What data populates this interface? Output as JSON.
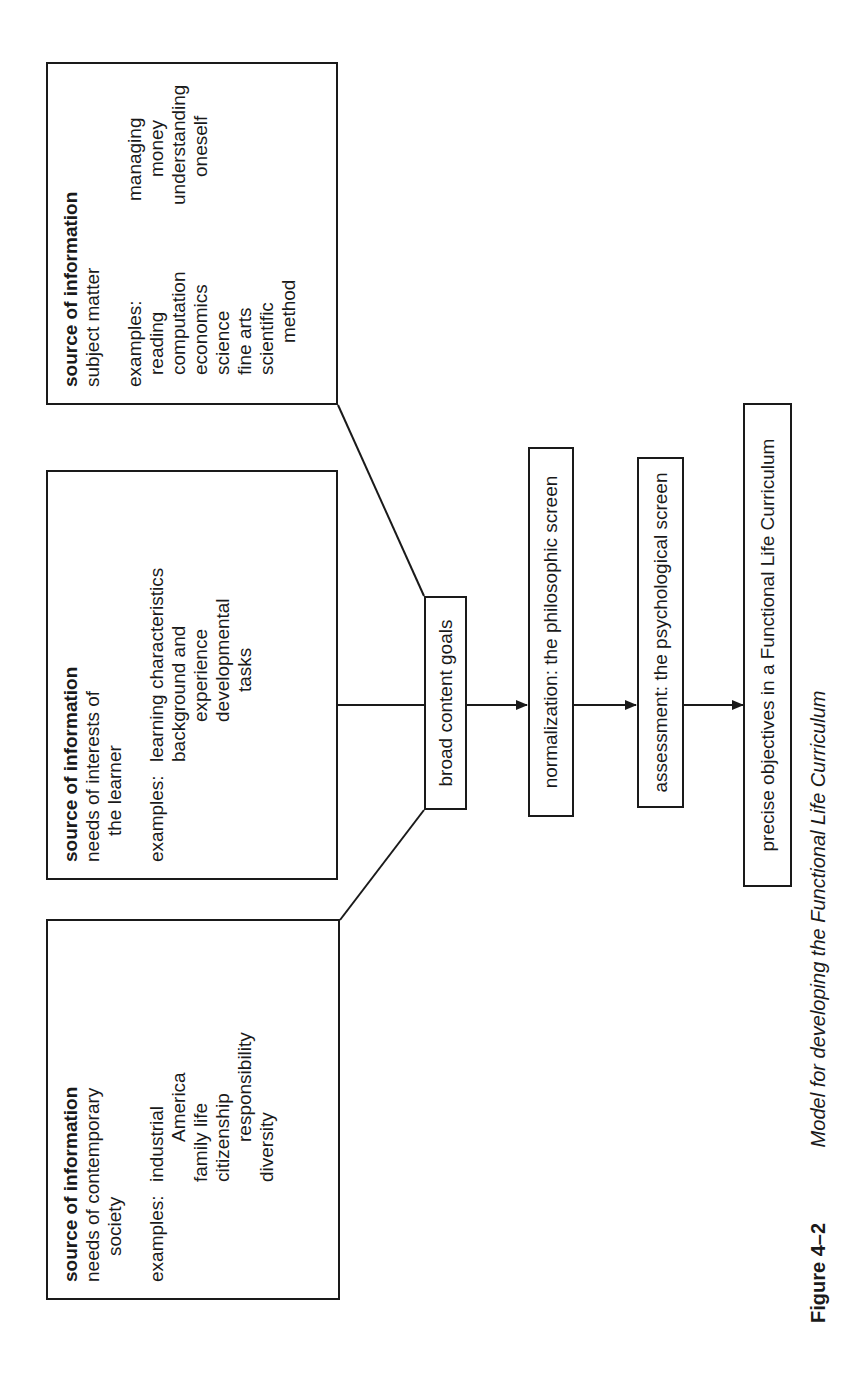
{
  "sources": [
    {
      "id": "society",
      "heading": "source of information",
      "subtitle_lines": [
        "needs of contemporary",
        "society"
      ],
      "examples_label": "examples:",
      "examples": [
        "industrial",
        "America",
        "family life",
        "citizenship",
        "responsibility",
        "diversity"
      ]
    },
    {
      "id": "learner",
      "heading": "source of information",
      "subtitle_lines": [
        "needs of interests of",
        "the learner"
      ],
      "examples_label": "examples:",
      "examples": [
        "learning characteristics",
        "background and",
        "experience",
        "developmental",
        "tasks"
      ]
    },
    {
      "id": "subject",
      "heading": "source of information",
      "subtitle_lines": [
        "subject matter"
      ],
      "examples_label": "examples:",
      "examples_col1": [
        "reading",
        "computation",
        "economics",
        "science",
        "fine arts",
        "scientific",
        "method"
      ],
      "examples_col2": [
        "managing",
        "money",
        "understanding",
        "oneself"
      ]
    }
  ],
  "steps": [
    {
      "id": "broad",
      "label": "broad content goals"
    },
    {
      "id": "normalization",
      "label": "normalization: the philosophic screen"
    },
    {
      "id": "assessment",
      "label": "assessment: the psychological screen"
    },
    {
      "id": "precise",
      "label": "precise objectives in a Functional Life Curriculum"
    }
  ],
  "caption": {
    "figure_number": "Figure 4–2",
    "title": "Model for developing the Functional Life Curriculum"
  }
}
